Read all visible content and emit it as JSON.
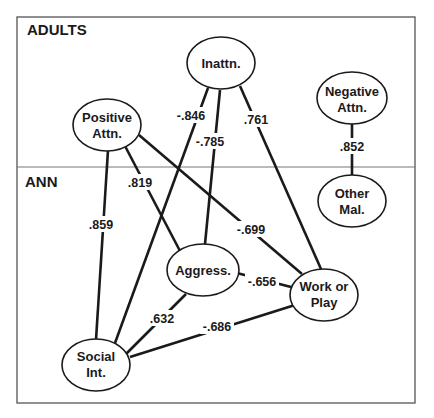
{
  "sections": {
    "top": "ADULTS",
    "bottom": "ANN"
  },
  "nodes": {
    "inattn": {
      "lines": [
        "Inattn."
      ]
    },
    "positive_attn": {
      "lines": [
        "Positive",
        "Attn."
      ]
    },
    "negative_attn": {
      "lines": [
        "Negative",
        "Attn."
      ]
    },
    "other_mal": {
      "lines": [
        "Other",
        "Mal."
      ]
    },
    "aggress": {
      "lines": [
        "Aggress."
      ]
    },
    "work_or_play": {
      "lines": [
        "Work or",
        "Play"
      ]
    },
    "social_int": {
      "lines": [
        "Social",
        "Int."
      ]
    }
  },
  "edges": [
    {
      "from": "Inattn.",
      "to": "Social Int.",
      "label": "-.846"
    },
    {
      "from": "Inattn.",
      "to": "Aggress.",
      "label": "-.785"
    },
    {
      "from": "Inattn.",
      "to": "Work or Play",
      "label": ".761"
    },
    {
      "from": "Negative Attn.",
      "to": "Other Mal.",
      "label": ".852"
    },
    {
      "from": "Positive Attn.",
      "to": "Social Int.",
      "label": ".859"
    },
    {
      "from": "Positive Attn.",
      "to": "Aggress.",
      "label": ".819"
    },
    {
      "from": "Positive Attn.",
      "to": "Work or Play",
      "label": "-.699"
    },
    {
      "from": "Aggress.",
      "to": "Work or Play",
      "label": "-.656"
    },
    {
      "from": "Aggress.",
      "to": "Social Int.",
      "label": ".632"
    },
    {
      "from": "Social Int.",
      "to": "Work or Play",
      "label": "-.686"
    }
  ]
}
